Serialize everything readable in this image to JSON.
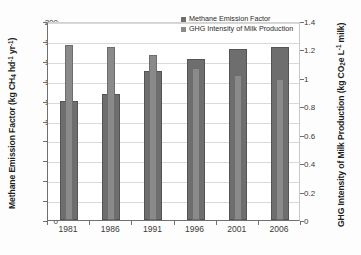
{
  "chart_data": {
    "type": "bar",
    "title": "",
    "categories": [
      "1981",
      "1986",
      "1991",
      "1996",
      "2001",
      "2006"
    ],
    "series": [
      {
        "name": "Methane Emission Factor",
        "axis": "left",
        "color": "#6e6e6e",
        "values": [
          120,
          127,
          150,
          162,
          172,
          174
        ]
      },
      {
        "name": "GHG Intensity of Milk Production",
        "axis": "right",
        "color": "#8a8a8a",
        "values": [
          1.23,
          1.22,
          1.16,
          1.07,
          1.02,
          0.99
        ]
      }
    ],
    "xlabel": "",
    "ylabel_left": "Methane Emission Factor (kg CH4 hd-1 yr-1)",
    "ylabel_right": "GHG Intensity of Milk Production (kg CO2e L-1 milk)",
    "ylim_left": [
      0,
      200
    ],
    "ylim_right": [
      0,
      1.4
    ],
    "yticks_left": [
      "0",
      "20",
      "40",
      "60",
      "80",
      "100",
      "120",
      "140",
      "160",
      "180",
      "200"
    ],
    "yticks_right": [
      "0",
      "0.2",
      "0.4",
      "0.6",
      "0.8",
      "1",
      "1.2",
      "1.4"
    ],
    "grid": true,
    "legend_position": "top-center"
  },
  "axes": {
    "left_title": {
      "p1": "Methane Emission Factor (kg CH",
      "sub1": "4",
      "p2": " hd",
      "sup1": "-1",
      "p3": " yr",
      "sup2": "-1",
      "p4": ")"
    },
    "right_title": {
      "p1": "GHG Intensity of Milk Production (kg CO",
      "sub1": "2",
      "p2": "e L",
      "sup1": "-1",
      "p3": " milk)"
    }
  },
  "legend": {
    "items": [
      {
        "label": "Methane Emission Factor"
      },
      {
        "label": "GHG Intensity of Milk Production"
      }
    ]
  }
}
